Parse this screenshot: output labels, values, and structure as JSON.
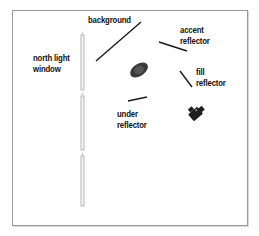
{
  "diagram": {
    "title": "",
    "type": "studio lighting setup (top view)",
    "colors": {
      "frame": "#9a9a9a",
      "reflector_line": "#1a1a1a",
      "label_text": "#111111",
      "window": "#b0b0b0",
      "subject": "#3a3a3a",
      "camera": "#1e1e1e"
    },
    "labels": {
      "background": {
        "line1": "background"
      },
      "accent_reflector": {
        "line1": "accent",
        "line2": "reflector"
      },
      "fill_reflector": {
        "line1": "fill",
        "line2": "reflector"
      },
      "north_light_window": {
        "line1": "north light",
        "line2": "window"
      },
      "under_reflector": {
        "line1": "under",
        "line2": "reflector"
      }
    },
    "elements": [
      {
        "name": "background",
        "shape": "line"
      },
      {
        "name": "accent reflector",
        "shape": "line"
      },
      {
        "name": "fill reflector",
        "shape": "line"
      },
      {
        "name": "under reflector",
        "shape": "line"
      },
      {
        "name": "north light window",
        "shape": "three vertical panels"
      },
      {
        "name": "subject",
        "shape": "dark ellipse"
      },
      {
        "name": "camera",
        "shape": "camera glyph"
      }
    ]
  }
}
